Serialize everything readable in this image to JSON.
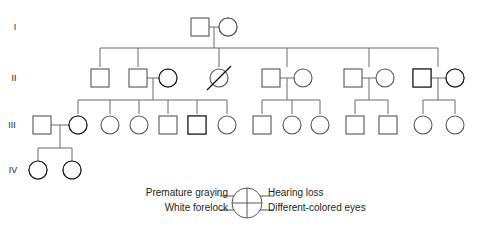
{
  "figure": {
    "type": "pedigree-chart",
    "title": "",
    "width": 482,
    "height": 228,
    "background": "#ffffff",
    "line_color": "#6b6b6b",
    "fill_color": "#000000",
    "symbol_outline": "#555555"
  },
  "generations": [
    {
      "label": "I",
      "y": 27,
      "label_x": 15,
      "label_y": 30
    },
    {
      "label": "II",
      "y": 78,
      "label_x": 14,
      "label_y": 81
    },
    {
      "label": "III",
      "y": 125,
      "label_x": 12,
      "label_y": 128
    },
    {
      "label": "IV",
      "y": 170,
      "label_x": 13,
      "label_y": 173
    }
  ],
  "quadrant_traits": {
    "upper_left": "Premature graying",
    "upper_right": "Hearing loss",
    "lower_left": "White forelock",
    "lower_right": "Different-colored eyes"
  },
  "legend": {
    "left_labels": [
      "Premature graying",
      "White forelock"
    ],
    "right_labels": [
      "Hearing loss",
      "Different-colored eyes"
    ],
    "symbol_name": "quadrant-key-circle",
    "left_label_anchor_x": 228,
    "right_label_anchor_x": 268,
    "row_y": [
      196,
      211
    ],
    "circle_cx": 247,
    "circle_cy": 203,
    "circle_r": 15
  },
  "individuals": [
    {
      "id": "I-1",
      "gen": 1,
      "sex": "male",
      "cx": 200,
      "cy": 27,
      "fill": "none",
      "deceased": false
    },
    {
      "id": "I-2",
      "gen": 1,
      "sex": "female",
      "cx": 228,
      "cy": 27,
      "fill": "full",
      "deceased": false
    },
    {
      "id": "II-1",
      "gen": 2,
      "sex": "male",
      "cx": 100,
      "cy": 78,
      "fill": "none",
      "deceased": false
    },
    {
      "id": "II-2",
      "gen": 2,
      "sex": "male",
      "cx": 138,
      "cy": 78,
      "fill": "none",
      "deceased": false
    },
    {
      "id": "II-3",
      "gen": 2,
      "sex": "female",
      "cx": 168,
      "cy": 78,
      "fill": "three-q",
      "deceased": false
    },
    {
      "id": "II-4",
      "gen": 2,
      "sex": "female",
      "cx": 219,
      "cy": 78,
      "fill": "none",
      "deceased": true
    },
    {
      "id": "II-5",
      "gen": 2,
      "sex": "male",
      "cx": 271,
      "cy": 78,
      "fill": "none",
      "deceased": false
    },
    {
      "id": "II-6",
      "gen": 2,
      "sex": "female",
      "cx": 303,
      "cy": 78,
      "fill": "none",
      "deceased": false
    },
    {
      "id": "II-7",
      "gen": 2,
      "sex": "male",
      "cx": 353,
      "cy": 78,
      "fill": "none",
      "deceased": false
    },
    {
      "id": "II-8",
      "gen": 2,
      "sex": "female",
      "cx": 385,
      "cy": 78,
      "fill": "none",
      "deceased": false
    },
    {
      "id": "II-9",
      "gen": 2,
      "sex": "male",
      "cx": 422,
      "cy": 78,
      "fill": "upper-right",
      "deceased": false
    },
    {
      "id": "II-10",
      "gen": 2,
      "sex": "female",
      "cx": 455,
      "cy": 78,
      "fill": "three-q",
      "deceased": false
    },
    {
      "id": "III-1",
      "gen": 3,
      "sex": "male",
      "cx": 42,
      "cy": 125,
      "fill": "none",
      "deceased": false
    },
    {
      "id": "III-2",
      "gen": 3,
      "sex": "female",
      "cx": 78,
      "cy": 125,
      "fill": "bottom-half",
      "deceased": false
    },
    {
      "id": "III-3",
      "gen": 3,
      "sex": "female",
      "cx": 110,
      "cy": 125,
      "fill": "none",
      "deceased": false
    },
    {
      "id": "III-4",
      "gen": 3,
      "sex": "female",
      "cx": 139,
      "cy": 125,
      "fill": "none",
      "deceased": false
    },
    {
      "id": "III-5",
      "gen": 3,
      "sex": "male",
      "cx": 168,
      "cy": 125,
      "fill": "none",
      "deceased": false
    },
    {
      "id": "III-6",
      "gen": 3,
      "sex": "male",
      "cx": 197,
      "cy": 125,
      "fill": "left-half",
      "deceased": false
    },
    {
      "id": "III-7",
      "gen": 3,
      "sex": "female",
      "cx": 227,
      "cy": 125,
      "fill": "none",
      "deceased": false
    },
    {
      "id": "III-8",
      "gen": 3,
      "sex": "male",
      "cx": 262,
      "cy": 125,
      "fill": "none",
      "deceased": false
    },
    {
      "id": "III-9",
      "gen": 3,
      "sex": "female",
      "cx": 292,
      "cy": 125,
      "fill": "none",
      "deceased": false
    },
    {
      "id": "III-10",
      "gen": 3,
      "sex": "female",
      "cx": 320,
      "cy": 125,
      "fill": "none",
      "deceased": false
    },
    {
      "id": "III-11",
      "gen": 3,
      "sex": "male",
      "cx": 355,
      "cy": 125,
      "fill": "none",
      "deceased": false
    },
    {
      "id": "III-12",
      "gen": 3,
      "sex": "male",
      "cx": 388,
      "cy": 125,
      "fill": "none",
      "deceased": false
    },
    {
      "id": "III-13",
      "gen": 3,
      "sex": "female",
      "cx": 423,
      "cy": 125,
      "fill": "none",
      "deceased": false
    },
    {
      "id": "III-14",
      "gen": 3,
      "sex": "female",
      "cx": 455,
      "cy": 125,
      "fill": "none",
      "deceased": false
    },
    {
      "id": "IV-1",
      "gen": 4,
      "sex": "female",
      "cx": 38,
      "cy": 170,
      "fill": "right-half",
      "deceased": false
    },
    {
      "id": "IV-2",
      "gen": 4,
      "sex": "female",
      "cx": 72,
      "cy": 170,
      "fill": "three-q",
      "deceased": false
    }
  ],
  "matings": [
    {
      "id": "m-I",
      "left": 200,
      "right": 228,
      "y": 27,
      "drop_x": 214,
      "drop_to": 48
    },
    {
      "id": "m-II-a",
      "left": 138,
      "right": 168,
      "y": 78,
      "drop_x": 153,
      "drop_to": 100
    },
    {
      "id": "m-II-b",
      "left": 271,
      "right": 303,
      "y": 78,
      "drop_x": 287,
      "drop_to": 100
    },
    {
      "id": "m-II-c",
      "left": 353,
      "right": 385,
      "y": 78,
      "drop_x": 369,
      "drop_to": 100
    },
    {
      "id": "m-II-d",
      "left": 422,
      "right": 455,
      "y": 78,
      "drop_x": 438,
      "drop_to": 100
    },
    {
      "id": "m-III-a",
      "left": 42,
      "right": 78,
      "y": 125,
      "drop_x": 60,
      "drop_to": 148
    }
  ],
  "sibships": [
    {
      "id": "sib-II",
      "bar_y": 48,
      "from_x": 100,
      "to_x": 438,
      "children_x": [
        100,
        138,
        219,
        287,
        369,
        438
      ],
      "child_top": 67
    },
    {
      "id": "sib-III-a",
      "bar_y": 100,
      "from_x": 78,
      "to_x": 227,
      "children_x": [
        78,
        110,
        139,
        168,
        197,
        227
      ],
      "child_top": 114
    },
    {
      "id": "sib-III-b",
      "bar_y": 100,
      "from_x": 262,
      "to_x": 320,
      "children_x": [
        262,
        292,
        320
      ],
      "child_top": 114
    },
    {
      "id": "sib-III-c",
      "bar_y": 100,
      "from_x": 355,
      "to_x": 388,
      "children_x": [
        355,
        388
      ],
      "child_top": 114
    },
    {
      "id": "sib-III-d",
      "bar_y": 100,
      "from_x": 423,
      "to_x": 455,
      "children_x": [
        423,
        455
      ],
      "child_top": 114
    },
    {
      "id": "sib-IV",
      "bar_y": 148,
      "from_x": 38,
      "to_x": 72,
      "children_x": [
        38,
        72
      ],
      "child_top": 160
    }
  ]
}
